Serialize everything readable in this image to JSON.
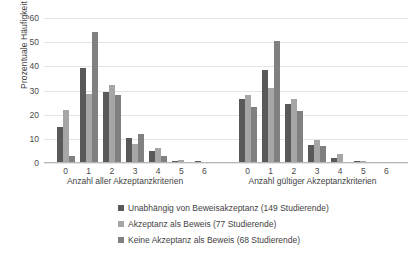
{
  "chart_data": {
    "type": "bar",
    "title": "",
    "xlabel": "",
    "ylabel": "Prozentuale Häufigkeit",
    "ylim": [
      0,
      60
    ],
    "yticks": [
      0,
      10,
      20,
      30,
      40,
      50,
      60
    ],
    "grid": true,
    "legend_position": "bottom",
    "groups": [
      {
        "name": "Anzahl aller Akzeptanzkriterien",
        "categories": [
          "0",
          "1",
          "2",
          "3",
          "4",
          "5",
          "6"
        ]
      },
      {
        "name": "Anzahl gültiger Akzeptanzkriterien",
        "categories": [
          "0",
          "1",
          "2",
          "3",
          "4",
          "5",
          "6"
        ]
      }
    ],
    "series": [
      {
        "name": "Unabhängig von Beweisakzeptanz (149 Studierende)",
        "color": "#595959",
        "values_group1": [
          15.0,
          39.5,
          29.5,
          10.2,
          4.8,
          0.8,
          0.8
        ],
        "values_group2": [
          26.5,
          38.5,
          24.5,
          7.5,
          2.0,
          0.7,
          0.0
        ]
      },
      {
        "name": "Akzeptanz als Beweis (77 Studierende)",
        "color": "#a6a6a6",
        "values_group1": [
          22.0,
          28.6,
          32.2,
          7.9,
          6.4,
          1.1,
          0.0
        ],
        "values_group2": [
          28.0,
          31.0,
          26.5,
          9.5,
          3.8,
          0.9,
          0.0
        ]
      },
      {
        "name": "Keine Akzeptanz als Beweis (68 Studierende)",
        "color": "#808080",
        "values_group1": [
          3.0,
          54.2,
          28.0,
          11.8,
          3.0,
          0.0,
          0.0
        ],
        "values_group2": [
          23.0,
          50.5,
          21.5,
          7.0,
          0.0,
          0.6,
          0.0
        ]
      }
    ]
  },
  "legend": {
    "items": [
      {
        "label": "Unabhängig von Beweisakzeptanz (149 Studierende)",
        "color": "#595959"
      },
      {
        "label": "Akzeptanz als Beweis (77 Studierende)",
        "color": "#a6a6a6"
      },
      {
        "label": "Keine Akzeptanz als Beweis (68 Studierende)",
        "color": "#808080"
      }
    ]
  }
}
